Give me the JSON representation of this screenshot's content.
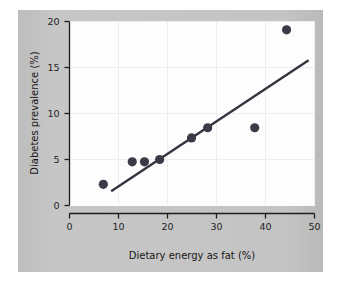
{
  "figure": {
    "background_color": "#ffffff",
    "panel_color": "#c3c3c3",
    "plot_area_color": "#fdfdfd"
  },
  "axes": {
    "x_title": "Dietary energy as fat (%)",
    "y_title": "Diabetes prevalence (%)",
    "x_ticks": [
      "0",
      "10",
      "20",
      "30",
      "40",
      "50"
    ],
    "y_ticks": [
      "0",
      "5",
      "10",
      "15",
      "20"
    ]
  },
  "chart_data": {
    "type": "scatter",
    "title": "",
    "xlabel": "Dietary energy as fat (%)",
    "ylabel": "Diabetes prevalence (%)",
    "xlim": [
      0,
      50
    ],
    "ylim": [
      0,
      20
    ],
    "xticks": [
      0,
      10,
      20,
      30,
      40,
      50
    ],
    "yticks": [
      0,
      5,
      10,
      15,
      20
    ],
    "grid": true,
    "legend": false,
    "marker_color": "#3b3b47",
    "marker_size": 4.6,
    "points": [
      {
        "x": 6.9,
        "y": 2.3
      },
      {
        "x": 12.8,
        "y": 4.75
      },
      {
        "x": 15.3,
        "y": 4.75
      },
      {
        "x": 18.4,
        "y": 5.0
      },
      {
        "x": 24.9,
        "y": 7.35
      },
      {
        "x": 28.2,
        "y": 8.45
      },
      {
        "x": 37.8,
        "y": 8.45
      },
      {
        "x": 44.3,
        "y": 19.1
      }
    ],
    "trendline": {
      "type": "linear-fit",
      "color": "#35353f",
      "width": 2.4,
      "x_start": 8.5,
      "y_start": 1.55,
      "x_end": 48.8,
      "y_end": 15.8
    }
  }
}
